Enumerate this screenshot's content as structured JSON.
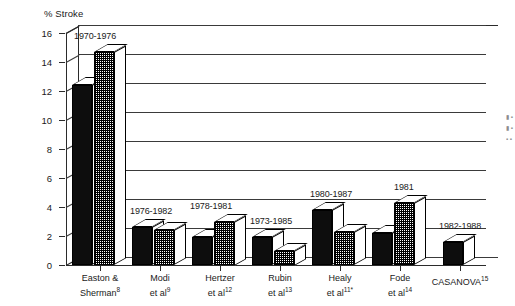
{
  "chart_data": {
    "type": "bar",
    "title": "% Stroke",
    "xlabel": "",
    "ylabel": "% Stroke",
    "ylim": [
      0,
      16
    ],
    "yticks": [
      0,
      2,
      4,
      6,
      8,
      10,
      12,
      14,
      16
    ],
    "grid": true,
    "legend": "none",
    "categories": [
      "Easton & Sherman8",
      "Modi et al9",
      "Hertzer et al12",
      "Rubin et al13",
      "Healy et al11*",
      "Fode et al14",
      "CASANOVA15"
    ],
    "annotations": [
      "1970-1976",
      "1976-1982",
      "1978-1981",
      "1973-1985",
      "1980-1987",
      "1981",
      "1982-1988"
    ],
    "series": [
      {
        "name": "black",
        "values": [
          12.4,
          2.6,
          1.9,
          1.9,
          3.8,
          2.2,
          1.6
        ]
      },
      {
        "name": "hatched",
        "values": [
          14.7,
          2.4,
          3.0,
          1.0,
          2.3,
          4.3,
          null
        ]
      }
    ]
  },
  "axis": {
    "y_title": "% Stroke",
    "y_ticks": [
      "16",
      "14",
      "12",
      "10",
      "8",
      "6",
      "4",
      "2",
      "0"
    ]
  },
  "groups": [
    {
      "year": "1970-1976",
      "label_line1": "Easton &",
      "label_line2": "Sherman",
      "label_sup": "8",
      "black": 12.4,
      "hatch": 14.7
    },
    {
      "year": "1976-1982",
      "label_line1": "Modi",
      "label_line2": "et al",
      "label_sup": "9",
      "black": 2.6,
      "hatch": 2.4
    },
    {
      "year": "1978-1981",
      "label_line1": "Hertzer",
      "label_line2": "et al",
      "label_sup": "12",
      "black": 1.9,
      "hatch": 3.0
    },
    {
      "year": "1973-1985",
      "label_line1": "Rubin",
      "label_line2": "et al",
      "label_sup": "13",
      "black": 1.9,
      "hatch": 1.0
    },
    {
      "year": "1980-1987",
      "label_line1": "Healy",
      "label_line2": "et al",
      "label_sup": "11*",
      "black": 3.8,
      "hatch": 2.3
    },
    {
      "year": "1981",
      "label_line1": "Fode",
      "label_line2": "et al",
      "label_sup": "14",
      "black": 2.2,
      "hatch": 4.3
    },
    {
      "year": "1982-1988",
      "label_line1": "CASANOVA",
      "label_line2": "",
      "label_sup": "15",
      "black": 1.6,
      "hatch": null
    }
  ],
  "colors": {
    "black_bar": "#0d0d0d",
    "hatched_bar": "#808080",
    "axis": "#2b2b2b",
    "background": "#ffffff"
  }
}
